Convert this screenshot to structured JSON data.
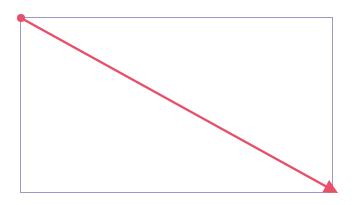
{
  "diagram": {
    "canvas": {
      "width": 359,
      "height": 205,
      "background": "#ffffff"
    },
    "rectangle": {
      "x": 20,
      "y": 17,
      "width": 312,
      "height": 175,
      "stroke": "#9a9ac8",
      "stroke_width": 1
    },
    "arrow": {
      "start": {
        "x": 21,
        "y": 18
      },
      "end": {
        "x": 338,
        "y": 193
      },
      "color": "#e8506a",
      "stroke_width": 2.5,
      "start_marker": "dot",
      "end_marker": "arrowhead"
    }
  }
}
